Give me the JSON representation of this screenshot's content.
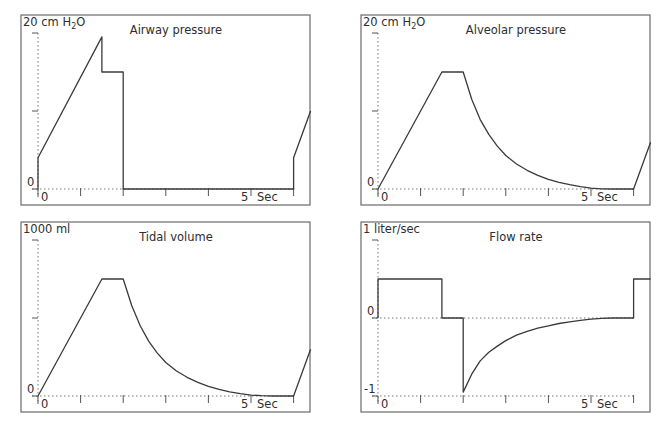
{
  "chart_data": [
    {
      "type": "line",
      "id": "airway",
      "title": "Airway pressure",
      "ylabel": "20 cm H2O",
      "ylabel_main": "20 cm H",
      "ylabel_sub": "2",
      "ylabel_tail": "O",
      "xlabel": "Sec",
      "ylim": [
        0,
        20
      ],
      "xlim": [
        0,
        6.4
      ],
      "y_ticks": [
        0,
        10,
        20
      ],
      "y_tick_labels": [
        {
          "value": 0,
          "text": "0"
        }
      ],
      "x_ticks": [
        0,
        1,
        2,
        3,
        4,
        5,
        6
      ],
      "x_tick_labels": [
        {
          "value": 0,
          "text": "0"
        },
        {
          "value": 5,
          "text": "5"
        }
      ],
      "zero_line": 0,
      "points": [
        [
          0,
          0
        ],
        [
          0,
          4
        ],
        [
          1.5,
          19.5
        ],
        [
          1.5,
          15
        ],
        [
          2,
          15
        ],
        [
          2,
          0
        ],
        [
          6,
          0
        ],
        [
          6,
          4
        ],
        [
          6.4,
          10
        ]
      ]
    },
    {
      "type": "line",
      "id": "alveolar",
      "title": "Alveolar pressure",
      "ylabel": "20 cm H2O",
      "ylabel_main": "20 cm H",
      "ylabel_sub": "2",
      "ylabel_tail": "O",
      "xlabel": "Sec",
      "ylim": [
        0,
        20
      ],
      "xlim": [
        0,
        6.4
      ],
      "y_ticks": [
        0,
        10,
        20
      ],
      "y_tick_labels": [
        {
          "value": 0,
          "text": "0"
        }
      ],
      "x_ticks": [
        0,
        1,
        2,
        3,
        4,
        5,
        6
      ],
      "x_tick_labels": [
        {
          "value": 0,
          "text": "0"
        },
        {
          "value": 5,
          "text": "5"
        }
      ],
      "zero_line": 0,
      "points": [
        [
          0,
          0
        ],
        [
          1.5,
          15
        ],
        [
          2,
          15
        ],
        [
          2.2,
          11.5
        ],
        [
          2.4,
          8.9
        ],
        [
          2.6,
          7.0
        ],
        [
          2.8,
          5.5
        ],
        [
          3,
          4.3
        ],
        [
          3.25,
          3.2
        ],
        [
          3.5,
          2.4
        ],
        [
          3.75,
          1.75
        ],
        [
          4,
          1.25
        ],
        [
          4.25,
          0.85
        ],
        [
          4.5,
          0.55
        ],
        [
          4.75,
          0.3
        ],
        [
          5,
          0.12
        ],
        [
          5.25,
          0.03
        ],
        [
          5.5,
          0
        ],
        [
          6,
          0
        ],
        [
          6.4,
          6
        ]
      ]
    },
    {
      "type": "line",
      "id": "tidal",
      "title": "Tidal volume",
      "ylabel": "1000 ml",
      "xlabel": "Sec",
      "ylim": [
        0,
        1000
      ],
      "xlim": [
        0,
        6.4
      ],
      "y_ticks": [
        0,
        500,
        1000
      ],
      "y_tick_labels": [
        {
          "value": 0,
          "text": "0"
        }
      ],
      "x_ticks": [
        0,
        1,
        2,
        3,
        4,
        5,
        6
      ],
      "x_tick_labels": [
        {
          "value": 0,
          "text": "0"
        },
        {
          "value": 5,
          "text": "5"
        }
      ],
      "zero_line": 0,
      "points": [
        [
          0,
          0
        ],
        [
          1.5,
          750
        ],
        [
          2,
          750
        ],
        [
          2.2,
          580
        ],
        [
          2.4,
          450
        ],
        [
          2.6,
          350
        ],
        [
          2.8,
          275
        ],
        [
          3,
          215
        ],
        [
          3.25,
          160
        ],
        [
          3.5,
          120
        ],
        [
          3.75,
          88
        ],
        [
          4,
          62
        ],
        [
          4.25,
          42
        ],
        [
          4.5,
          27
        ],
        [
          4.75,
          15
        ],
        [
          5,
          6
        ],
        [
          5.25,
          2
        ],
        [
          5.5,
          0
        ],
        [
          6,
          0
        ],
        [
          6.4,
          300
        ]
      ]
    },
    {
      "type": "line",
      "id": "flow",
      "title": "Flow rate",
      "ylabel": "1 liter/sec",
      "xlabel": "Sec",
      "ylim": [
        -1,
        1
      ],
      "xlim": [
        0,
        6.4
      ],
      "y_ticks": [
        -1,
        0,
        1
      ],
      "y_tick_labels": [
        {
          "value": 0,
          "text": "0"
        },
        {
          "value": -1,
          "text": "-1"
        }
      ],
      "x_ticks": [
        0,
        1,
        2,
        3,
        4,
        5,
        6
      ],
      "x_tick_labels": [
        {
          "value": 0,
          "text": "0"
        },
        {
          "value": 5,
          "text": "5"
        }
      ],
      "zero_line": 0,
      "bottom_line": -1,
      "points": [
        [
          0,
          0
        ],
        [
          0,
          0.5
        ],
        [
          1.5,
          0.5
        ],
        [
          1.5,
          0
        ],
        [
          2,
          0
        ],
        [
          2,
          -0.95
        ],
        [
          2.2,
          -0.72
        ],
        [
          2.4,
          -0.55
        ],
        [
          2.6,
          -0.44
        ],
        [
          2.8,
          -0.36
        ],
        [
          3,
          -0.29
        ],
        [
          3.25,
          -0.22
        ],
        [
          3.5,
          -0.17
        ],
        [
          3.75,
          -0.13
        ],
        [
          4,
          -0.1
        ],
        [
          4.25,
          -0.07
        ],
        [
          4.5,
          -0.05
        ],
        [
          4.75,
          -0.03
        ],
        [
          5,
          -0.015
        ],
        [
          5.25,
          -0.005
        ],
        [
          5.5,
          0
        ],
        [
          6,
          0
        ],
        [
          6,
          0.5
        ],
        [
          6.4,
          0.5
        ]
      ]
    }
  ]
}
